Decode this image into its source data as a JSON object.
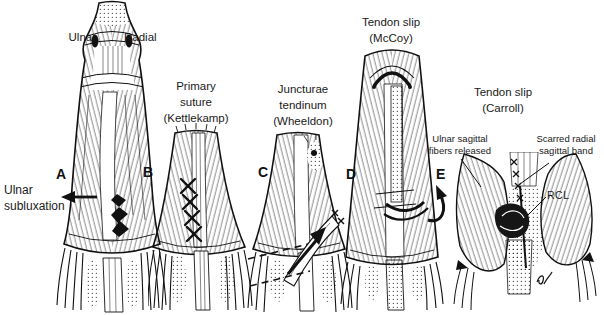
{
  "colors": {
    "background": "#ffffff",
    "ink": "#1a1a1a"
  },
  "panels": [
    {
      "letter": "A",
      "title": ""
    },
    {
      "letter": "B",
      "title": "Primary\nsuture\n(Kettlekamp)"
    },
    {
      "letter": "C",
      "title": "Juncturae\ntendinum\n(Wheeldon)"
    },
    {
      "letter": "D",
      "title": "Tendon slip\n(McCoy)"
    },
    {
      "letter": "E",
      "title": "Tendon slip\n(Carroll)"
    }
  ],
  "annotations": {
    "ulnar": "Ulnar",
    "radial": "Radial",
    "ulnar_subluxation": "Ulnar\nsubluxation",
    "ulnar_sagittal_fibers": "Ulnar sagittal\nfibers released",
    "scarred_radial_band": "Scarred radial\nsagittal band",
    "rcl": "RCL"
  }
}
